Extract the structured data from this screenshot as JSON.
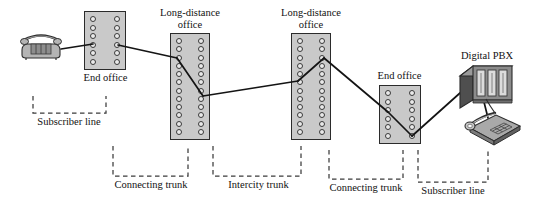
{
  "figure": {
    "type": "telephone-network-topology-diagram"
  },
  "nodes": [
    {
      "id": "phone-left",
      "kind": "analog-telephone",
      "label": ""
    },
    {
      "id": "end-office-left",
      "kind": "switching-office",
      "label": "End office",
      "rows": 6
    },
    {
      "id": "ld-office-1",
      "kind": "switching-office",
      "label": "Long-distance\noffice",
      "label_line1": "Long-distance",
      "label_line2": "office",
      "rows": 12
    },
    {
      "id": "ld-office-2",
      "kind": "switching-office",
      "label": "Long-distance\noffice",
      "label_line1": "Long-distance",
      "label_line2": "office",
      "rows": 12
    },
    {
      "id": "end-office-right",
      "kind": "switching-office",
      "label": "End office",
      "rows": 6
    },
    {
      "id": "digital-pbx",
      "kind": "pbx-cabinet",
      "label": "Digital PBX"
    },
    {
      "id": "phone-right",
      "kind": "desk-telephone",
      "label": ""
    }
  ],
  "labels": {
    "end_office_left": "End office",
    "ld_office_1_line1": "Long-distance",
    "ld_office_1_line2": "office",
    "ld_office_2_line1": "Long-distance",
    "ld_office_2_line2": "office",
    "end_office_right": "End office",
    "digital_pbx": "Digital PBX",
    "subscriber_line_left": "Subscriber line",
    "connecting_trunk_left": "Connecting trunk",
    "intercity_trunk": "Intercity trunk",
    "connecting_trunk_right": "Connecting trunk",
    "subscriber_line_right": "Subscriber line"
  },
  "segments": [
    {
      "name": "subscriber-line-left",
      "label": "Subscriber line",
      "from": "phone-left",
      "to": "end-office-left"
    },
    {
      "name": "connecting-trunk-left",
      "label": "Connecting trunk",
      "from": "end-office-left",
      "to": "ld-office-1"
    },
    {
      "name": "intercity-trunk",
      "label": "Intercity trunk",
      "from": "ld-office-1",
      "to": "ld-office-2"
    },
    {
      "name": "connecting-trunk-right",
      "label": "Connecting trunk",
      "from": "ld-office-2",
      "to": "end-office-right"
    },
    {
      "name": "subscriber-line-right",
      "label": "Subscriber line",
      "from": "end-office-right",
      "to": "digital-pbx"
    }
  ],
  "colors": {
    "background": "#ffffff",
    "office_fill": "#c9c9c9",
    "office_stroke": "#2b2b2b",
    "port_fill": "#e9e9e9",
    "port_stroke": "#3a3a3a",
    "wire": "#141414",
    "bracket": "#3b3b3b",
    "text": "#111111",
    "device_dark": "#555555",
    "device_mid": "#8a8a8a",
    "device_light": "#c4c4c4"
  }
}
